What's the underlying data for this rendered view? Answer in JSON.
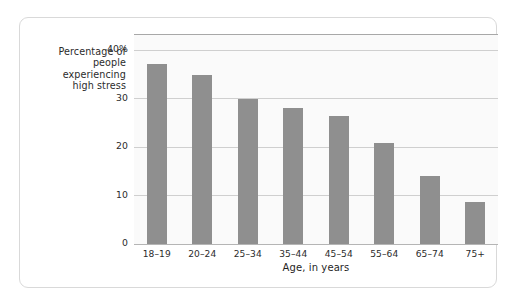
{
  "chart_data": {
    "type": "bar",
    "title": "",
    "subtitle": "",
    "xlabel": "Age, in years",
    "ylabel": "Percentage of people experiencing high stress",
    "ylabel_lines": [
      "Percentage of",
      "people",
      "experiencing",
      "high stress"
    ],
    "categories": [
      "18–19",
      "20–24",
      "25–34",
      "35–44",
      "45–54",
      "55–64",
      "65–74",
      "75+"
    ],
    "values": [
      37.0,
      34.7,
      29.8,
      28.0,
      26.4,
      20.8,
      13.9,
      8.6
    ],
    "ylim": [
      0,
      43
    ],
    "yticks": [
      0,
      10,
      20,
      30,
      40
    ],
    "ytick_labels": [
      "0",
      "10",
      "20",
      "30",
      "40%"
    ],
    "grid": true,
    "grid_axis": "y",
    "legend": false,
    "bar_color": "#8f8f8f",
    "plot_background": "#fafafa",
    "gridline_color": "#cfcfcf",
    "card_border_color": "#d9d9d9"
  }
}
